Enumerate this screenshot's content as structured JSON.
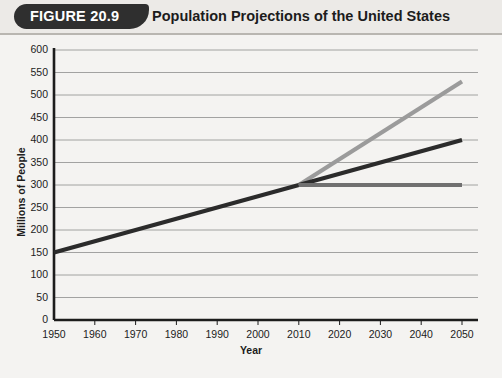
{
  "header": {
    "badge_label": "FIGURE 20.9",
    "title": "Population Projections of the United States"
  },
  "chart_data": {
    "type": "line",
    "title": "Population Projections of the United States",
    "xlabel": "Year",
    "ylabel": "Millions of People",
    "xlim": [
      1950,
      2050
    ],
    "ylim": [
      0,
      600
    ],
    "xticks": [
      1950,
      1960,
      1970,
      1980,
      1990,
      2000,
      2010,
      2020,
      2030,
      2040,
      2050
    ],
    "yticks": [
      0,
      50,
      100,
      150,
      200,
      250,
      300,
      350,
      400,
      450,
      500,
      550,
      600
    ],
    "grid": "horizontal",
    "legend": "none",
    "series": [
      {
        "name": "Historical population",
        "color": "#2b2b2b",
        "width": 4.2,
        "x": [
          1950,
          2010
        ],
        "values": [
          150,
          300
        ]
      },
      {
        "name": "High projection",
        "color": "#9b9b9b",
        "width": 4.2,
        "x": [
          2010,
          2050
        ],
        "values": [
          300,
          530
        ]
      },
      {
        "name": "Middle projection",
        "color": "#2b2b2b",
        "width": 4.2,
        "x": [
          2010,
          2050
        ],
        "values": [
          300,
          400
        ]
      },
      {
        "name": "Low projection",
        "color": "#707070",
        "width": 4.2,
        "x": [
          2010,
          2050
        ],
        "values": [
          300,
          300
        ]
      }
    ]
  },
  "colors": {
    "background": "#f4f3f1",
    "header_band": "#eceae7",
    "badge": "#2f2f2f",
    "axis": "#1c1c1c",
    "gridline": "#8d8d8d"
  }
}
